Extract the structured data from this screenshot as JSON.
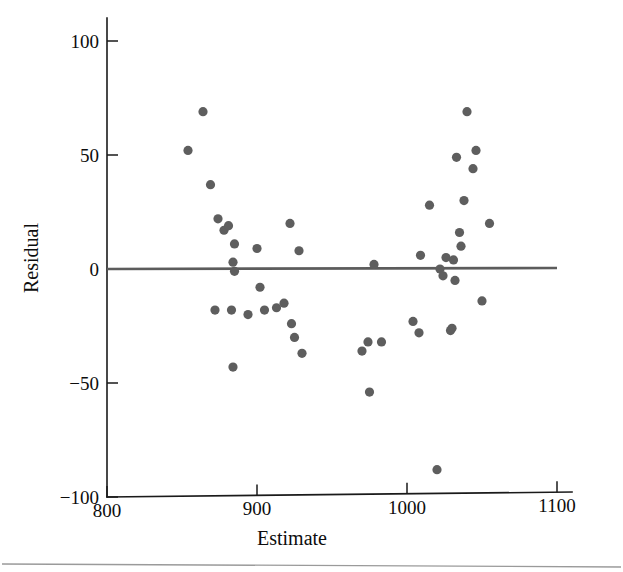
{
  "chart_data": {
    "type": "scatter",
    "title": "",
    "subtitle": "",
    "xlabel": "Estimate",
    "ylabel": "Residual",
    "xlim": [
      800,
      1115
    ],
    "ylim": [
      -100,
      110
    ],
    "xticks": [
      800,
      900,
      1000,
      1100
    ],
    "yticks": [
      100,
      50,
      0,
      -50,
      -100
    ],
    "xtick_labels": [
      "800",
      "900",
      "1000",
      "1100"
    ],
    "ytick_labels": [
      "100",
      "50",
      "0",
      "−50",
      "−100"
    ],
    "grid": false,
    "legend": null,
    "annotations": [],
    "reference_line": {
      "name": "zero-residual-line",
      "type": "horizontal",
      "y": 0,
      "x_start": 800,
      "x_end": 1100,
      "color": "#5c5c5c"
    },
    "marker": {
      "shape": "circle",
      "color": "#5e5e5e",
      "radius_px": 4.6
    },
    "point_count": 49,
    "x": [
      864,
      854,
      869,
      874,
      878,
      881,
      885,
      884,
      885,
      883,
      872,
      894,
      900,
      902,
      905,
      913,
      918,
      922,
      923,
      925,
      925,
      928,
      932,
      938,
      970,
      974,
      978,
      975,
      983,
      1004,
      1009,
      1008,
      1015,
      1020,
      1022,
      1024,
      1026,
      1029,
      1030,
      1031,
      1032,
      1033,
      1035,
      1036,
      1038,
      1040,
      1044,
      1046,
      1050
    ],
    "y": [
      69,
      52,
      37,
      22,
      17,
      19,
      11,
      3,
      -1,
      -18,
      -18,
      -20,
      9,
      -8,
      -18,
      -17,
      -15,
      20,
      -24,
      -30,
      8,
      -37,
      -43,
      -54,
      -36,
      -32,
      2,
      -54,
      -32,
      -23,
      6,
      -28,
      28,
      -88,
      0,
      -3,
      5,
      -27,
      -26,
      4,
      -5,
      49,
      16,
      10,
      30,
      69,
      44,
      52,
      -14
    ],
    "points": [
      {
        "x": 864,
        "y": 69
      },
      {
        "x": 854,
        "y": 52
      },
      {
        "x": 869,
        "y": 37
      },
      {
        "x": 874,
        "y": 22
      },
      {
        "x": 878,
        "y": 17
      },
      {
        "x": 881,
        "y": 19
      },
      {
        "x": 885,
        "y": 11
      },
      {
        "x": 884,
        "y": 3
      },
      {
        "x": 885,
        "y": -1
      },
      {
        "x": 883,
        "y": -18
      },
      {
        "x": 872,
        "y": -18
      },
      {
        "x": 894,
        "y": -20
      },
      {
        "x": 900,
        "y": 9
      },
      {
        "x": 902,
        "y": -8
      },
      {
        "x": 905,
        "y": -18
      },
      {
        "x": 913,
        "y": -17
      },
      {
        "x": 918,
        "y": -15
      },
      {
        "x": 922,
        "y": 20
      },
      {
        "x": 923,
        "y": -24
      },
      {
        "x": 925,
        "y": -30
      },
      {
        "x": 928,
        "y": 8
      },
      {
        "x": 930,
        "y": -37
      },
      {
        "x": 884,
        "y": -43
      },
      {
        "x": 975,
        "y": -54
      },
      {
        "x": 970,
        "y": -36
      },
      {
        "x": 974,
        "y": -32
      },
      {
        "x": 978,
        "y": 2
      },
      {
        "x": 983,
        "y": -32
      },
      {
        "x": 1004,
        "y": -23
      },
      {
        "x": 1009,
        "y": 6
      },
      {
        "x": 1008,
        "y": -28
      },
      {
        "x": 1015,
        "y": 28
      },
      {
        "x": 1020,
        "y": -88
      },
      {
        "x": 1022,
        "y": 0
      },
      {
        "x": 1024,
        "y": -3
      },
      {
        "x": 1026,
        "y": 5
      },
      {
        "x": 1029,
        "y": -27
      },
      {
        "x": 1030,
        "y": -26
      },
      {
        "x": 1031,
        "y": 4
      },
      {
        "x": 1032,
        "y": -5
      },
      {
        "x": 1033,
        "y": 49
      },
      {
        "x": 1035,
        "y": 16
      },
      {
        "x": 1036,
        "y": 10
      },
      {
        "x": 1038,
        "y": 30
      },
      {
        "x": 1040,
        "y": 69
      },
      {
        "x": 1044,
        "y": 44
      },
      {
        "x": 1046,
        "y": 52
      },
      {
        "x": 1050,
        "y": -14
      },
      {
        "x": 1055,
        "y": 20
      }
    ]
  },
  "figure": {
    "background_color": "#ffffff",
    "axis_color": "#1a1a1a",
    "divider_color": "#9a9a9a"
  }
}
